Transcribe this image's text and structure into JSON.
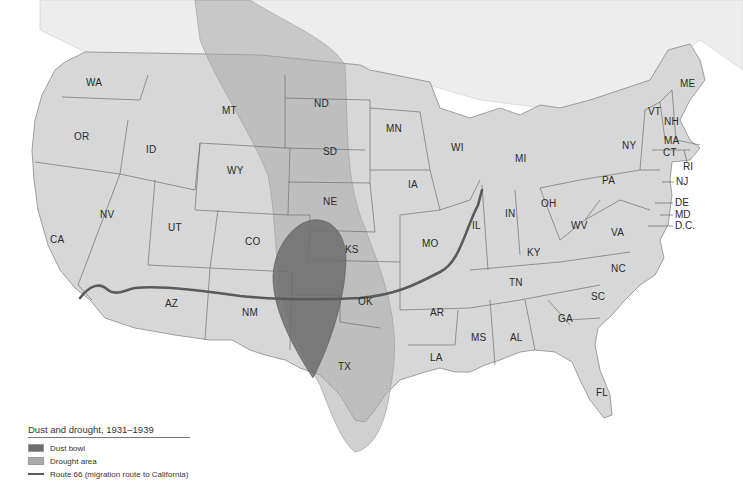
{
  "map": {
    "title": "Dust and drought, 1931–1939",
    "colors": {
      "background": "#ffffff",
      "land": "#d6d6d6",
      "land_north": "#e6e6e6",
      "state_border": "#6e6e6e",
      "drought_area": "#a9a9a9",
      "dust_bowl": "#6d6d6d",
      "route_66": "#5a5a5a"
    },
    "states": [
      {
        "abbr": "WA",
        "x": 94,
        "y": 83
      },
      {
        "abbr": "OR",
        "x": 82,
        "y": 137
      },
      {
        "abbr": "ID",
        "x": 152,
        "y": 150
      },
      {
        "abbr": "MT",
        "x": 230,
        "y": 111
      },
      {
        "abbr": "ND",
        "x": 322,
        "y": 104
      },
      {
        "abbr": "SD",
        "x": 331,
        "y": 152
      },
      {
        "abbr": "WY",
        "x": 235,
        "y": 171
      },
      {
        "abbr": "NE",
        "x": 331,
        "y": 202
      },
      {
        "abbr": "NV",
        "x": 108,
        "y": 215
      },
      {
        "abbr": "UT",
        "x": 175,
        "y": 228
      },
      {
        "abbr": "CO",
        "x": 253,
        "y": 242
      },
      {
        "abbr": "CA",
        "x": 58,
        "y": 240
      },
      {
        "abbr": "KS",
        "x": 343,
        "y": 250
      },
      {
        "abbr": "AZ",
        "x": 164,
        "y": 304
      },
      {
        "abbr": "NM",
        "x": 242,
        "y": 313
      },
      {
        "abbr": "OK",
        "x": 356,
        "y": 302
      },
      {
        "abbr": "TX",
        "x": 336,
        "y": 367
      },
      {
        "abbr": "MN",
        "x": 386,
        "y": 129
      },
      {
        "abbr": "WI",
        "x": 451,
        "y": 148
      },
      {
        "abbr": "MI",
        "x": 516,
        "y": 159
      },
      {
        "abbr": "IA",
        "x": 408,
        "y": 185
      },
      {
        "abbr": "IL",
        "x": 472,
        "y": 226
      },
      {
        "abbr": "IN",
        "x": 505,
        "y": 214
      },
      {
        "abbr": "OH",
        "x": 541,
        "y": 204
      },
      {
        "abbr": "MO",
        "x": 422,
        "y": 244
      },
      {
        "abbr": "KY",
        "x": 527,
        "y": 253
      },
      {
        "abbr": "WV",
        "x": 571,
        "y": 226
      },
      {
        "abbr": "VA",
        "x": 611,
        "y": 233
      },
      {
        "abbr": "TN",
        "x": 509,
        "y": 283
      },
      {
        "abbr": "NC",
        "x": 611,
        "y": 269
      },
      {
        "abbr": "SC",
        "x": 591,
        "y": 297
      },
      {
        "abbr": "AR",
        "x": 436,
        "y": 313
      },
      {
        "abbr": "MS",
        "x": 472,
        "y": 338
      },
      {
        "abbr": "AL",
        "x": 510,
        "y": 338
      },
      {
        "abbr": "GA",
        "x": 557,
        "y": 319
      },
      {
        "abbr": "LA",
        "x": 431,
        "y": 358
      },
      {
        "abbr": "FL",
        "x": 597,
        "y": 391
      },
      {
        "abbr": "PA",
        "x": 609,
        "y": 181
      },
      {
        "abbr": "NY",
        "x": 624,
        "y": 146
      },
      {
        "abbr": "VT",
        "x": 652,
        "y": 112
      },
      {
        "abbr": "NH",
        "x": 665,
        "y": 122
      },
      {
        "abbr": "ME",
        "x": 682,
        "y": 84
      },
      {
        "abbr": "MA",
        "x": 665,
        "y": 141
      },
      {
        "abbr": "CT",
        "x": 663,
        "y": 153
      }
    ],
    "callouts": [
      {
        "abbr": "RI",
        "x": 684,
        "y": 166
      },
      {
        "abbr": "NJ",
        "x": 676,
        "y": 182
      },
      {
        "abbr": "DE",
        "x": 675,
        "y": 203
      },
      {
        "abbr": "MD",
        "x": 675,
        "y": 215
      },
      {
        "abbr": "D.C.",
        "x": 675,
        "y": 226
      }
    ]
  },
  "legend": {
    "title": "Dust and drought, 1931–1939",
    "items": [
      {
        "label": "Dust bowl",
        "type": "area",
        "color": "#6d6d6d"
      },
      {
        "label": "Drought area",
        "type": "area",
        "color": "#a9a9a9"
      },
      {
        "label": "Route 66 (migration route to California)",
        "type": "line",
        "color": "#5a5a5a"
      }
    ]
  }
}
